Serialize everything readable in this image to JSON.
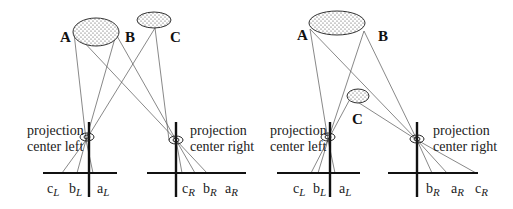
{
  "colors": {
    "line": "#555555",
    "axis": "#111111",
    "text": "#222222",
    "dot": "#444444"
  },
  "left_panel": {
    "objects": [
      {
        "label": "A"
      },
      {
        "label": "B"
      },
      {
        "label": "C"
      }
    ],
    "center_left": {
      "line1": "projection",
      "line2": "center left"
    },
    "center_right": {
      "line1": "projection",
      "line2": "center right"
    },
    "image_left": [
      {
        "letter": "c",
        "sub": "L"
      },
      {
        "letter": "b",
        "sub": "L"
      },
      {
        "letter": "a",
        "sub": "L"
      }
    ],
    "image_right": [
      {
        "letter": "c",
        "sub": "R"
      },
      {
        "letter": "b",
        "sub": "R"
      },
      {
        "letter": "a",
        "sub": "R"
      }
    ]
  },
  "right_panel": {
    "objects": [
      {
        "label": "A"
      },
      {
        "label": "B"
      },
      {
        "label": "C"
      }
    ],
    "center_left": {
      "line1": "projection",
      "line2": "center left"
    },
    "center_right": {
      "line1": "projection",
      "line2": "center right"
    },
    "image_left": [
      {
        "letter": "c",
        "sub": "L"
      },
      {
        "letter": "b",
        "sub": "L"
      },
      {
        "letter": "a",
        "sub": "L"
      }
    ],
    "image_right": [
      {
        "letter": "b",
        "sub": "R"
      },
      {
        "letter": "a",
        "sub": "R"
      },
      {
        "letter": "c",
        "sub": "R"
      }
    ]
  }
}
